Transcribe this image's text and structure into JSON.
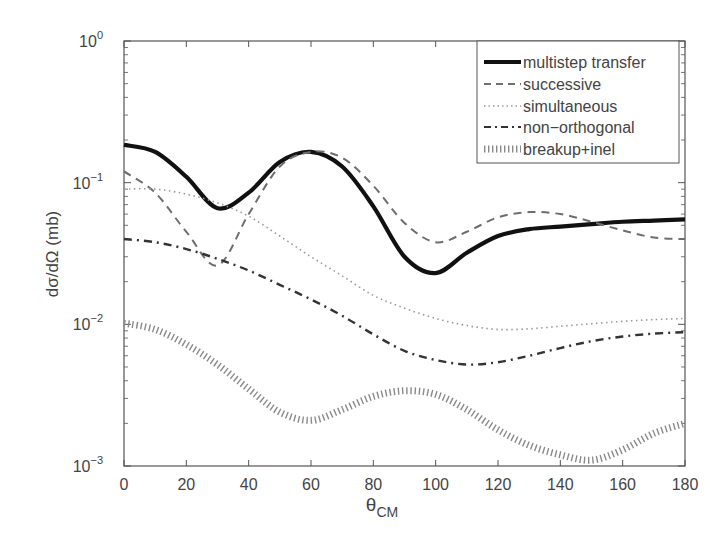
{
  "chart_data": {
    "type": "line",
    "title": "",
    "xlabel": "θ_CM",
    "xlabel_main": "θ",
    "xlabel_sub": "CM",
    "ylabel": "dσ/dΩ (mb)",
    "xlim": [
      0,
      180
    ],
    "ylim": [
      0.001,
      1
    ],
    "yscale": "log",
    "grid": false,
    "legend_position": "upper right",
    "x_ticks": [
      0,
      20,
      40,
      60,
      80,
      100,
      120,
      140,
      160,
      180
    ],
    "y_ticks": [
      {
        "base": "10",
        "exp": "0",
        "value": 1
      },
      {
        "base": "10",
        "exp": "−1",
        "value": 0.1
      },
      {
        "base": "10",
        "exp": "−2",
        "value": 0.01
      },
      {
        "base": "10",
        "exp": "−3",
        "value": 0.001
      }
    ],
    "x": [
      0,
      10,
      20,
      30,
      40,
      50,
      60,
      70,
      80,
      90,
      100,
      110,
      120,
      130,
      140,
      150,
      160,
      170,
      180
    ],
    "series": [
      {
        "name": "multistep transfer",
        "style": "solid-thick",
        "values": [
          0.185,
          0.165,
          0.11,
          0.066,
          0.085,
          0.14,
          0.165,
          0.13,
          0.068,
          0.03,
          0.023,
          0.032,
          0.042,
          0.047,
          0.049,
          0.051,
          0.053,
          0.054,
          0.055
        ]
      },
      {
        "name": "successive",
        "style": "dashed",
        "values": [
          0.12,
          0.085,
          0.045,
          0.026,
          0.06,
          0.13,
          0.165,
          0.15,
          0.095,
          0.052,
          0.038,
          0.045,
          0.057,
          0.062,
          0.06,
          0.053,
          0.046,
          0.041,
          0.04
        ]
      },
      {
        "name": "simultaneous",
        "style": "dotted",
        "values": [
          0.09,
          0.09,
          0.083,
          0.072,
          0.058,
          0.042,
          0.03,
          0.022,
          0.016,
          0.013,
          0.011,
          0.0098,
          0.0092,
          0.0093,
          0.0097,
          0.0101,
          0.0105,
          0.0108,
          0.011
        ]
      },
      {
        "name": "non-orthogonal",
        "style": "dash-dot",
        "values": [
          0.04,
          0.038,
          0.034,
          0.029,
          0.024,
          0.019,
          0.015,
          0.0115,
          0.0085,
          0.0065,
          0.0056,
          0.0052,
          0.0054,
          0.006,
          0.0068,
          0.0076,
          0.0082,
          0.0086,
          0.0088
        ]
      },
      {
        "name": "breakup+inel",
        "style": "hatched-thick",
        "values": [
          0.0102,
          0.0092,
          0.0072,
          0.0052,
          0.0035,
          0.0024,
          0.0021,
          0.0025,
          0.0031,
          0.0034,
          0.0032,
          0.0025,
          0.0018,
          0.0014,
          0.0012,
          0.0011,
          0.0013,
          0.0017,
          0.002
        ]
      }
    ]
  },
  "legend": {
    "items": [
      {
        "label": "multistep transfer"
      },
      {
        "label": "successive"
      },
      {
        "label": "simultaneous"
      },
      {
        "label": "non−orthogonal"
      },
      {
        "label": "breakup+inel"
      }
    ]
  },
  "axes": {
    "xlabel_main": "θ",
    "xlabel_sub": "CM",
    "ylabel": "dσ/dΩ (mb)"
  },
  "colors": {
    "solid": "#111111",
    "dashed": "#6e6e6e",
    "dotted": "#9a9a9a",
    "dashdot": "#333333",
    "hatched": "#8a8a8a",
    "axis": "#555555"
  }
}
